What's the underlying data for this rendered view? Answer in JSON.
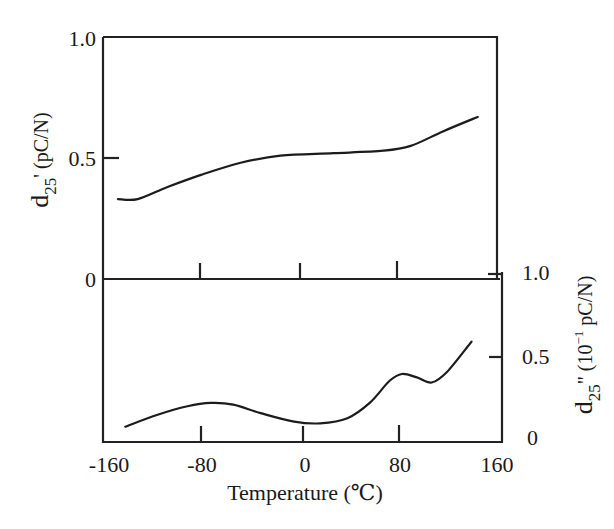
{
  "chart_data": [
    {
      "type": "line",
      "panel": "upper",
      "title": "",
      "xlabel": "Temperature (℃)",
      "ylabel": "d25' (pC/N)",
      "ylabel_main": "d",
      "ylabel_sub": "25",
      "ylabel_rest": "' (pC/N)",
      "xlim": [
        -160,
        160
      ],
      "ylim": [
        0,
        1.0
      ],
      "x_ticks": [
        -160,
        -80,
        0,
        80,
        160
      ],
      "y_ticks": [
        0,
        0.5,
        1.0
      ],
      "y_tick_labels": [
        "0",
        "0.5",
        "1.0"
      ],
      "y_axis_side": "left",
      "grid": false,
      "series": [
        {
          "name": "d25'",
          "x": [
            -148,
            -132,
            -108,
            -81,
            -49,
            -17,
            26,
            66,
            88,
            114,
            142
          ],
          "y": [
            0.33,
            0.33,
            0.38,
            0.43,
            0.48,
            0.51,
            0.52,
            0.53,
            0.55,
            0.61,
            0.67
          ]
        }
      ]
    },
    {
      "type": "line",
      "panel": "lower",
      "title": "",
      "xlabel": "Temperature (℃)",
      "ylabel": "d25\" (10^-1 pC/N)",
      "ylabel_main": "d",
      "ylabel_sub": "25",
      "ylabel_rest_a": "\" (10",
      "ylabel_sup": "−1",
      "ylabel_rest_b": " pC/N)",
      "xlim": [
        -160,
        160
      ],
      "ylim": [
        0,
        1.0
      ],
      "x_ticks": [
        -160,
        -80,
        0,
        80,
        160
      ],
      "x_tick_labels": [
        "-160",
        "-80",
        "0",
        "80",
        "160"
      ],
      "y_ticks": [
        0,
        0.5,
        1.0
      ],
      "y_tick_labels": [
        "0",
        "0.5",
        "1.0"
      ],
      "y_axis_side": "right",
      "grid": false,
      "series": [
        {
          "name": "d25\"",
          "x": [
            -142,
            -116,
            -92,
            -73,
            -55,
            -33,
            -6,
            15,
            37,
            55,
            71,
            81,
            93,
            105,
            117,
            137
          ],
          "y": [
            0.09,
            0.16,
            0.21,
            0.23,
            0.22,
            0.17,
            0.12,
            0.11,
            0.14,
            0.23,
            0.36,
            0.4,
            0.38,
            0.35,
            0.41,
            0.59
          ]
        }
      ]
    }
  ],
  "labels": {
    "upper_y_tick_0": "0",
    "upper_y_tick_05": "0.5",
    "upper_y_tick_10": "1.0",
    "lower_y_tick_0": "0",
    "lower_y_tick_05": "0.5",
    "lower_y_tick_10": "1.0",
    "x_tick_m160": "-160",
    "x_tick_m80": "-80",
    "x_tick_0": "0",
    "x_tick_80": "80",
    "x_tick_160": "160",
    "x_title": "Temperature (℃)",
    "upper_ylabel_main": "d",
    "upper_ylabel_sub": "25",
    "upper_ylabel_rest": "' (pC/N)",
    "lower_ylabel_main": "d",
    "lower_ylabel_sub": "25",
    "lower_ylabel_rest_a": "\" (10",
    "lower_ylabel_sup": "−1",
    "lower_ylabel_rest_b": " pC/N)"
  }
}
